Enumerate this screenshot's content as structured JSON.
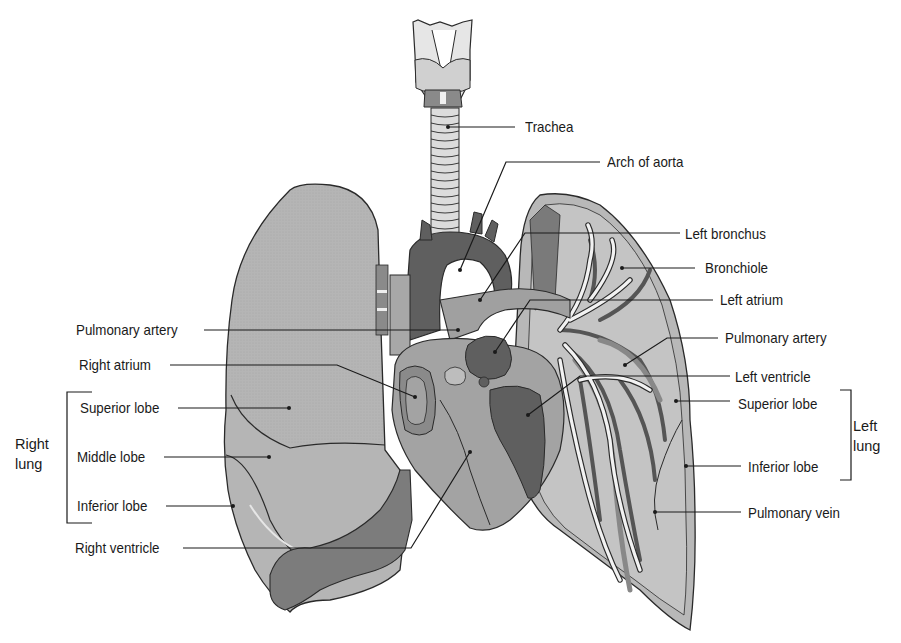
{
  "diagram": {
    "colors": {
      "lung_light": "#b8b8b8",
      "lung_mid": "#a3a3a3",
      "lung_dark": "#7a7a7a",
      "heart_dark": "#5f5f5f",
      "heart_mid": "#9a9a9a",
      "outline": "#2a2a2a",
      "leader_line": "#1a1a1a",
      "bronchi": "#f0f0f0",
      "text": "#1a1a1a"
    },
    "labels_left": [
      {
        "id": "pulmonary-artery-left",
        "text": "Pulmonary artery"
      },
      {
        "id": "right-atrium",
        "text": "Right atrium"
      },
      {
        "id": "superior-lobe-right",
        "text": "Superior lobe"
      },
      {
        "id": "middle-lobe",
        "text": "Middle lobe"
      },
      {
        "id": "inferior-lobe-right",
        "text": "Inferior lobe"
      },
      {
        "id": "right-ventricle",
        "text": "Right ventricle"
      }
    ],
    "labels_right": [
      {
        "id": "trachea",
        "text": "Trachea"
      },
      {
        "id": "arch-of-aorta",
        "text": "Arch of aorta"
      },
      {
        "id": "left-bronchus",
        "text": "Left bronchus"
      },
      {
        "id": "bronchiole",
        "text": "Bronchiole"
      },
      {
        "id": "left-atrium",
        "text": "Left atrium"
      },
      {
        "id": "pulmonary-artery-right",
        "text": "Pulmonary artery"
      },
      {
        "id": "left-ventricle",
        "text": "Left ventricle"
      },
      {
        "id": "superior-lobe-left",
        "text": "Superior lobe"
      },
      {
        "id": "inferior-lobe-left",
        "text": "Inferior lobe"
      },
      {
        "id": "pulmonary-vein",
        "text": "Pulmonary vein"
      }
    ],
    "groups": {
      "right_lung": {
        "line1": "Right",
        "line2": "lung"
      },
      "left_lung": {
        "line1": "Left",
        "line2": "lung"
      }
    }
  }
}
